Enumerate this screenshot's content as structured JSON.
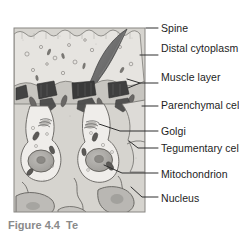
{
  "figure": {
    "title_hidden_caption": "Figure 4.4  Te",
    "panel": {
      "background_color": "#d8d6d2",
      "border_color": "#7d7b77",
      "x": 14,
      "y": 28,
      "width": 131,
      "height": 184
    },
    "spine": {
      "name": "Spine",
      "color": "#6f6f6f",
      "outline": "#4a4a4a"
    },
    "colors": {
      "tissue_light": "#eceae6",
      "tissue_mid": "#cfcdc8",
      "tissue_dark": "#9b9a96",
      "organelle_dark": "#4e4e4e",
      "nucleus_fill": "#b0aeaa",
      "line": "#5a5a5a",
      "label_text": "#1d1d1d",
      "leader_line": "#3a3a3a"
    },
    "labels": [
      {
        "id": "spine",
        "text": "Spine",
        "lines": [
          "Spine"
        ],
        "x": 161,
        "y": 22,
        "leader": {
          "x1": 146,
          "y1": 28,
          "x2": 158,
          "y2": 28
        }
      },
      {
        "id": "distal-cytoplasm",
        "text": "Distal cytoplasm",
        "lines": [
          "Distal",
          "cytoplasm"
        ],
        "x": 161,
        "y": 42,
        "leader": {
          "x1": 140,
          "y1": 55,
          "x2": 158,
          "y2": 55
        }
      },
      {
        "id": "muscle-layer",
        "text": "Muscle layer",
        "lines": [
          "Muscle",
          "layer"
        ],
        "x": 161,
        "y": 71,
        "leader": {
          "x1": 131,
          "y1": 86,
          "x2": 158,
          "y2": 83
        }
      },
      {
        "id": "parenchymal-cell",
        "text": "Parenchymal cell",
        "lines": [
          "Parenchymal",
          "cell"
        ],
        "x": 161,
        "y": 99,
        "leader": {
          "x1": 142,
          "y1": 106,
          "x2": 158,
          "y2": 106
        }
      },
      {
        "id": "golgi",
        "text": "Golgi",
        "lines": [
          "Golgi"
        ],
        "x": 161,
        "y": 125,
        "leader": {
          "x1": 100,
          "y1": 124,
          "x2": 158,
          "y2": 131
        }
      },
      {
        "id": "tegumentary-cell-body",
        "text": "Tegumentary cell body",
        "lines": [
          "Tegumentary",
          "cell body"
        ],
        "x": 161,
        "y": 142,
        "leader": {
          "x1": 129,
          "y1": 141,
          "x2": 158,
          "y2": 148
        }
      },
      {
        "id": "mitochondrion",
        "text": "Mitochondrion",
        "lines": [
          "Mitochondrion"
        ],
        "x": 161,
        "y": 168,
        "leader": {
          "x1": 104,
          "y1": 165,
          "x2": 158,
          "y2": 173
        }
      },
      {
        "id": "nucleus",
        "text": "Nucleus",
        "lines": [
          "Nucleus"
        ],
        "x": 161,
        "y": 192,
        "leader": {
          "x1": 131,
          "y1": 186,
          "x2": 158,
          "y2": 197
        }
      }
    ]
  }
}
